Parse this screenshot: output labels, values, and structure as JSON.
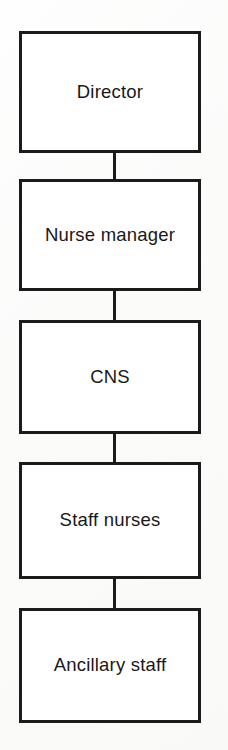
{
  "diagram": {
    "type": "organizational-hierarchy-flowchart",
    "orientation": "vertical-top-down",
    "title": "",
    "background_color": "#fdfdfc",
    "box_fill_color": "#ffffff",
    "line_color": "#1c1a1a",
    "text_color": "#1a1818",
    "nodes": [
      {
        "id": "director",
        "label": "Director",
        "level": 1
      },
      {
        "id": "nurse_manager",
        "label": "Nurse manager",
        "level": 2
      },
      {
        "id": "cns",
        "label": "CNS",
        "level": 3
      },
      {
        "id": "staff_nurses",
        "label": "Staff nurses",
        "level": 4
      },
      {
        "id": "ancillary",
        "label": "Ancillary staff",
        "level": 5
      }
    ],
    "connectors": [
      {
        "id": "c1",
        "from": "director",
        "to": "nurse_manager",
        "style": "vertical-line"
      },
      {
        "id": "c2",
        "from": "nurse_manager",
        "to": "cns",
        "style": "vertical-line"
      },
      {
        "id": "c3",
        "from": "cns",
        "to": "staff_nurses",
        "style": "vertical-line"
      },
      {
        "id": "c4",
        "from": "staff_nurses",
        "to": "ancillary",
        "style": "vertical-line"
      }
    ]
  }
}
